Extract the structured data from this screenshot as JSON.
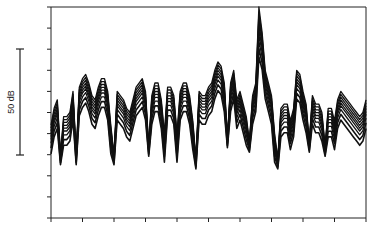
{
  "chart_data": {
    "type": "line",
    "title": "",
    "xlabel": "",
    "ylabel": "",
    "scale_bar": {
      "label": "50 dB",
      "span_db": 50
    },
    "grid": false,
    "legend": null,
    "x_ticks": 11,
    "y_ticks": 11,
    "x": [
      0,
      1,
      2,
      3,
      4,
      5,
      6,
      7,
      8,
      9,
      10,
      11,
      12,
      13,
      14,
      15,
      16,
      17,
      18,
      19,
      20,
      21,
      22,
      23,
      24,
      25,
      26,
      27,
      28,
      29,
      30,
      31,
      32,
      33,
      34,
      35,
      36,
      37,
      38,
      39,
      40,
      41,
      42,
      43,
      44,
      45,
      46,
      47,
      48,
      49,
      50,
      51,
      52,
      53,
      54,
      55,
      56,
      57,
      58,
      59,
      60,
      61,
      62,
      63,
      64,
      65,
      66,
      67,
      68,
      69,
      70,
      71,
      72,
      73,
      74,
      75,
      76,
      77,
      78,
      79,
      80,
      81,
      82,
      83,
      84,
      85,
      86,
      87,
      88,
      89,
      90,
      91,
      92,
      93,
      94,
      95,
      96,
      97,
      98,
      99,
      100
    ],
    "base_profile_top": [
      44,
      52,
      56,
      30,
      48,
      48,
      50,
      60,
      30,
      62,
      66,
      68,
      64,
      58,
      56,
      62,
      66,
      66,
      60,
      44,
      30,
      60,
      58,
      56,
      52,
      50,
      56,
      62,
      64,
      66,
      60,
      34,
      58,
      64,
      64,
      56,
      40,
      62,
      62,
      58,
      40,
      60,
      64,
      64,
      58,
      46,
      28,
      60,
      58,
      58,
      62,
      64,
      70,
      74,
      72,
      64,
      38,
      64,
      70,
      56,
      60,
      54,
      48,
      36,
      58,
      64,
      100,
      88,
      70,
      64,
      58,
      40,
      28,
      52,
      54,
      54,
      46,
      52,
      70,
      68,
      60,
      54,
      36,
      58,
      54,
      54,
      50,
      34,
      52,
      52,
      46,
      56,
      60,
      58,
      56,
      54,
      52,
      50,
      48,
      50,
      56
    ],
    "series": [
      {
        "name": "curve-1",
        "offset_db": 0
      },
      {
        "name": "curve-2",
        "offset_db": -3
      },
      {
        "name": "curve-3",
        "offset_db": -6
      },
      {
        "name": "curve-4",
        "offset_db": -9
      },
      {
        "name": "curve-5",
        "offset_db": -12
      },
      {
        "name": "curve-6",
        "offset_db": -15
      },
      {
        "name": "curve-7",
        "offset_db": -19
      },
      {
        "name": "curve-8",
        "offset_db": -24
      },
      {
        "name": "curve-9",
        "offset_db": -30
      }
    ]
  },
  "labels": {
    "scale_bar_text": "50 dB"
  }
}
